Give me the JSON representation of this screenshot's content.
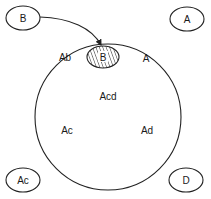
{
  "diagram": {
    "colors": {
      "stroke": "#222222",
      "text": "#1a1a1a",
      "background": "#ffffff"
    },
    "outer_nodes": [
      {
        "id": "node-b",
        "label": "B",
        "cx": 23,
        "cy": 18
      },
      {
        "id": "node-a",
        "label": "A",
        "cx": 187,
        "cy": 19
      },
      {
        "id": "node-ac",
        "label": "Ac",
        "cx": 23,
        "cy": 180
      },
      {
        "id": "node-d",
        "label": "D",
        "cx": 186,
        "cy": 180
      }
    ],
    "big_circle": {
      "regions": {
        "top_left": "Ab",
        "top_right": "A",
        "center": "Acd",
        "bottom_left": "Ac",
        "bottom_right": "Ad"
      }
    },
    "inner_hatched_node": {
      "label": "B"
    },
    "arrow": {
      "from": "B",
      "to": "B (hatched, inside circle)"
    }
  }
}
